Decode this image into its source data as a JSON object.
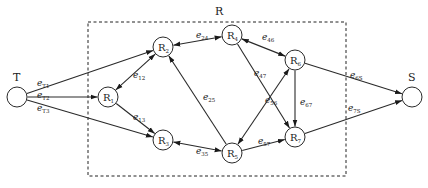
{
  "diagram": {
    "region_label": "R",
    "terminals": [
      {
        "id": "T",
        "label": "T"
      },
      {
        "id": "S",
        "label": "S"
      }
    ],
    "nodes": [
      {
        "id": "R1",
        "base": "R",
        "sub": "1"
      },
      {
        "id": "R2",
        "base": "R",
        "sub": "2"
      },
      {
        "id": "R3",
        "base": "R",
        "sub": "3"
      },
      {
        "id": "R4",
        "base": "R",
        "sub": "4"
      },
      {
        "id": "R5",
        "base": "R",
        "sub": "5"
      },
      {
        "id": "R6",
        "base": "R",
        "sub": "6"
      },
      {
        "id": "R7",
        "base": "R",
        "sub": "7"
      }
    ],
    "edges": [
      {
        "id": "eT1",
        "from": "T",
        "to": "R2",
        "base": "e",
        "sub": "T1",
        "bidirectional": false
      },
      {
        "id": "eT2",
        "from": "T",
        "to": "R1",
        "base": "e",
        "sub": "T2",
        "bidirectional": false
      },
      {
        "id": "eT3",
        "from": "T",
        "to": "R3",
        "base": "e",
        "sub": "T3",
        "bidirectional": false
      },
      {
        "id": "e12",
        "from": "R1",
        "to": "R2",
        "base": "e",
        "sub": "12",
        "bidirectional": true
      },
      {
        "id": "e13",
        "from": "R1",
        "to": "R3",
        "base": "e",
        "sub": "13",
        "bidirectional": false
      },
      {
        "id": "e24",
        "from": "R2",
        "to": "R4",
        "base": "e",
        "sub": "24",
        "bidirectional": true
      },
      {
        "id": "e25",
        "from": "R5",
        "to": "R2",
        "base": "e",
        "sub": "25",
        "bidirectional": false
      },
      {
        "id": "e35",
        "from": "R3",
        "to": "R5",
        "base": "e",
        "sub": "35",
        "bidirectional": true
      },
      {
        "id": "e46",
        "from": "R4",
        "to": "R6",
        "base": "e",
        "sub": "46",
        "bidirectional": true
      },
      {
        "id": "e47",
        "from": "R4",
        "to": "R7",
        "base": "e",
        "sub": "47",
        "bidirectional": false
      },
      {
        "id": "e56",
        "from": "R5",
        "to": "R6",
        "base": "e",
        "sub": "56",
        "bidirectional": true
      },
      {
        "id": "e57",
        "from": "R5",
        "to": "R7",
        "base": "e",
        "sub": "57",
        "bidirectional": false
      },
      {
        "id": "e67",
        "from": "R6",
        "to": "R7",
        "base": "e",
        "sub": "67",
        "bidirectional": false
      },
      {
        "id": "e6S",
        "from": "R6",
        "to": "S",
        "base": "e",
        "sub": "6S",
        "bidirectional": false
      },
      {
        "id": "e7S",
        "from": "R7",
        "to": "S",
        "base": "e",
        "sub": "7S",
        "bidirectional": false
      }
    ]
  }
}
